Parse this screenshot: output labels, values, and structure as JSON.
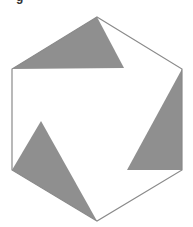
{
  "figure": {
    "label_fragment": "g",
    "colors": {
      "background": "#ffffff",
      "outline": "#8a8a8a",
      "fill": "#8f8f8f"
    },
    "hexagon": {
      "vertices": [
        [
          97,
          17
        ],
        [
          182,
          69
        ],
        [
          182,
          170
        ],
        [
          97,
          221
        ],
        [
          12,
          170
        ],
        [
          12,
          69
        ]
      ]
    },
    "shaded_triangles": [
      {
        "name": "top-triangle",
        "points": [
          [
            12,
            69
          ],
          [
            97,
            17
          ],
          [
            124,
            68
          ]
        ]
      },
      {
        "name": "right-triangle",
        "points": [
          [
            182,
            69
          ],
          [
            182,
            170
          ],
          [
            127,
            170
          ]
        ]
      },
      {
        "name": "left-triangle",
        "points": [
          [
            12,
            170
          ],
          [
            41,
            121
          ],
          [
            97,
            221
          ]
        ]
      }
    ]
  }
}
